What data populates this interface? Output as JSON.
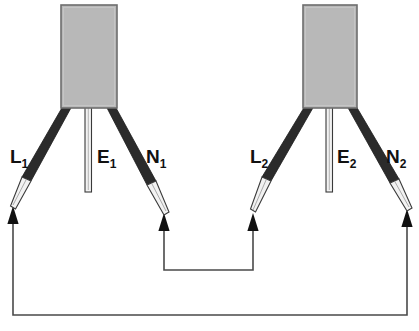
{
  "diagram": {
    "background_color": "#ffffff",
    "ink_color": "#111111",
    "block_fill_color": "#b8b8b8",
    "block_edge_color": "#6d6d6d",
    "sheath_color": "#2b2b2b",
    "tip_fill_color": "#f2f2f2",
    "tip_edge_color": "#3a3a3a",
    "connectors": [
      {
        "name": "connector-block-left",
        "index": 1,
        "leads": [
          {
            "id": "L1",
            "letter": "L",
            "sub": "1",
            "label": "L₁",
            "role": "line",
            "has_arrow": true,
            "label_x": 10,
            "label_y": 163
          },
          {
            "id": "E1",
            "letter": "E",
            "sub": "1",
            "label": "E₁",
            "role": "earth",
            "has_arrow": false,
            "label_x": 97,
            "label_y": 163
          },
          {
            "id": "N1",
            "letter": "N",
            "sub": "1",
            "label": "N₁",
            "role": "neutral",
            "has_arrow": true,
            "label_x": 146,
            "label_y": 163
          }
        ]
      },
      {
        "name": "connector-block-right",
        "index": 2,
        "leads": [
          {
            "id": "L2",
            "letter": "L",
            "sub": "2",
            "label": "L₂",
            "role": "line",
            "has_arrow": true,
            "label_x": 250,
            "label_y": 163
          },
          {
            "id": "E2",
            "letter": "E",
            "sub": "2",
            "label": "E₂",
            "role": "earth",
            "has_arrow": false,
            "label_x": 337,
            "label_y": 163
          },
          {
            "id": "N2",
            "letter": "N",
            "sub": "2",
            "label": "N₂",
            "role": "neutral",
            "has_arrow": true,
            "label_x": 386,
            "label_y": 163
          }
        ]
      }
    ],
    "links": [
      {
        "name": "inner-link",
        "from": "N1",
        "to": "L2",
        "description": "N₁ to L₂ inner loop"
      },
      {
        "name": "outer-link",
        "from": "L1",
        "to": "N2",
        "description": "L₁ to N₂ outer loop"
      }
    ]
  }
}
